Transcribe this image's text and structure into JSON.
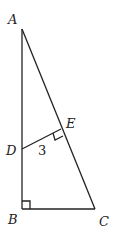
{
  "diagram": {
    "type": "geometry",
    "points": {
      "A": {
        "label": "A",
        "x": 22,
        "y": 29
      },
      "B": {
        "label": "B",
        "x": 22,
        "y": 209
      },
      "C": {
        "label": "C",
        "x": 95,
        "y": 209
      },
      "D": {
        "label": "D",
        "x": 22,
        "y": 149
      },
      "E": {
        "label": "E",
        "x": 61,
        "y": 129
      }
    },
    "segments": [
      "AB",
      "BC",
      "AC",
      "DE"
    ],
    "right_angles": [
      "B",
      "E"
    ],
    "measurements": {
      "DE": "3"
    }
  }
}
